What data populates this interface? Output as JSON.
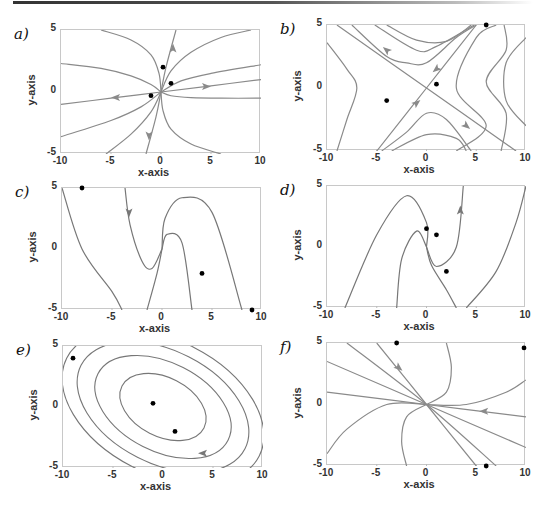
{
  "figure": {
    "panels": [
      {
        "id": "a",
        "label": "a)"
      },
      {
        "id": "b",
        "label": "b)"
      },
      {
        "id": "c",
        "label": "c)"
      },
      {
        "id": "d",
        "label": "d)"
      },
      {
        "id": "e",
        "label": "e)"
      },
      {
        "id": "f",
        "label": "f)"
      }
    ]
  },
  "chart_data": [
    {
      "panel": "a)",
      "type": "line",
      "title": "",
      "subtype": "phase portrait (unstable node)",
      "xlabel": "x-axis",
      "ylabel": "y-axis",
      "xlim": [
        -10,
        10
      ],
      "ylim": [
        -5,
        5
      ],
      "xticks": [
        "-10",
        "-5",
        "0",
        "5",
        "10"
      ],
      "yticks": [
        "-5",
        "0",
        "5"
      ],
      "grid": false,
      "line_color": "#8a8a8a",
      "points": [
        [
          0.2,
          2.0
        ],
        [
          1.0,
          0.7
        ],
        [
          -1.0,
          -0.3
        ]
      ],
      "trajectories": [
        [
          [
            -6,
            5
          ],
          [
            -3,
            4.2
          ],
          [
            -1,
            3
          ],
          [
            -0.2,
            1.5
          ],
          [
            0,
            0
          ]
        ],
        [
          [
            0,
            0
          ],
          [
            0.2,
            -1.5
          ],
          [
            1,
            -3
          ],
          [
            3,
            -4.2
          ],
          [
            6,
            -5
          ]
        ],
        [
          [
            -10,
            2.3
          ],
          [
            -6,
            1.9
          ],
          [
            -3,
            1.3
          ],
          [
            -1,
            0.6
          ],
          [
            0,
            0
          ]
        ],
        [
          [
            0,
            0
          ],
          [
            1,
            -0.3
          ],
          [
            3,
            -0.45
          ],
          [
            6,
            -0.5
          ],
          [
            10,
            -0.5
          ]
        ],
        [
          [
            0,
            0
          ],
          [
            1,
            1.7
          ],
          [
            3,
            3.2
          ],
          [
            6,
            4.4
          ],
          [
            9,
            5
          ]
        ],
        [
          [
            0,
            0
          ],
          [
            2,
            0.9
          ],
          [
            5,
            1.5
          ],
          [
            10,
            2.2
          ]
        ],
        [
          [
            -10,
            -1.0
          ],
          [
            -5,
            -0.5
          ],
          [
            0,
            0
          ],
          [
            5,
            0.5
          ],
          [
            10,
            1.0
          ]
        ],
        [
          [
            -1.5,
            -5
          ],
          [
            -0.5,
            -2
          ],
          [
            0,
            0
          ],
          [
            0.5,
            2
          ],
          [
            1.5,
            5
          ]
        ],
        [
          [
            -10,
            -3.6
          ],
          [
            -5,
            -2.3
          ],
          [
            -2,
            -1.2
          ],
          [
            0,
            0
          ]
        ],
        [
          [
            -5.5,
            -5
          ],
          [
            -3,
            -3.4
          ],
          [
            -1,
            -1.6
          ],
          [
            0,
            0
          ]
        ]
      ],
      "arrows": [
        [
          1.2,
          3.5,
          "up"
        ],
        [
          -4.5,
          -0.45,
          "left"
        ],
        [
          4.5,
          0.45,
          "right"
        ],
        [
          -1.2,
          -3.5,
          "down"
        ]
      ]
    },
    {
      "panel": "b)",
      "type": "line",
      "subtype": "phase portrait (saddle)",
      "xlabel": "x-axis",
      "ylabel": "y-axis",
      "xlim": [
        -10,
        10
      ],
      "ylim": [
        -5,
        5
      ],
      "xticks": [
        "-10",
        "-5",
        "0",
        "5",
        "10"
      ],
      "yticks": [
        "-5",
        "0",
        "5"
      ],
      "grid": false,
      "line_color": "#8a8a8a",
      "points": [
        [
          -4.0,
          -1.0
        ],
        [
          1.0,
          0.3
        ],
        [
          6.0,
          5.0
        ]
      ],
      "trajectories": [
        [
          [
            -9,
            5
          ],
          [
            0,
            0
          ],
          [
            9,
            -5
          ]
        ],
        [
          [
            -5,
            -5
          ],
          [
            0,
            0
          ],
          [
            5,
            5
          ]
        ],
        [
          [
            -10,
            3.6
          ],
          [
            -8,
            1.5
          ],
          [
            -7,
            0
          ],
          [
            -8,
            -2.5
          ],
          [
            -9,
            -5
          ]
        ],
        [
          [
            -7.5,
            5
          ],
          [
            -4,
            2.5
          ],
          [
            -2,
            2
          ],
          [
            0,
            2
          ],
          [
            3,
            4
          ],
          [
            5,
            5
          ]
        ],
        [
          [
            -5.2,
            5
          ],
          [
            -1,
            3
          ],
          [
            1,
            3.3
          ],
          [
            4.8,
            5
          ]
        ],
        [
          [
            -4,
            5
          ],
          [
            -1,
            3.8
          ],
          [
            2,
            3.7
          ],
          [
            4.5,
            5
          ]
        ],
        [
          [
            -4.5,
            -5
          ],
          [
            -2,
            -3.5
          ],
          [
            0,
            -2
          ],
          [
            2,
            -2.5
          ],
          [
            4.5,
            -5
          ]
        ],
        [
          [
            -3.5,
            -5
          ],
          [
            0,
            -3.7
          ],
          [
            3,
            -4
          ],
          [
            4,
            -5
          ]
        ],
        [
          [
            3,
            -5
          ],
          [
            6,
            -3
          ],
          [
            3,
            0
          ],
          [
            5,
            4
          ],
          [
            7,
            5
          ]
        ],
        [
          [
            7.5,
            -5
          ],
          [
            8,
            -2
          ],
          [
            6,
            0.5
          ],
          [
            8,
            3
          ],
          [
            7.8,
            5
          ]
        ],
        [
          [
            10,
            -3
          ],
          [
            8,
            -1
          ],
          [
            8,
            2
          ],
          [
            10,
            4
          ]
        ]
      ],
      "arrows": [
        [
          -4,
          3,
          "up-left"
        ],
        [
          4,
          -3,
          "down-right"
        ],
        [
          1,
          1.5,
          "down-left"
        ],
        [
          -1,
          -1.2,
          "up-right"
        ]
      ]
    },
    {
      "panel": "c)",
      "type": "line",
      "subtype": "phase portrait (stable spiral)",
      "xlabel": "x-axis",
      "ylabel": "y-axis",
      "xlim": [
        -10,
        10
      ],
      "ylim": [
        -5,
        5
      ],
      "xticks": [
        "-10",
        "-5",
        "0",
        "5",
        "10"
      ],
      "yticks": [
        "-5",
        "0",
        "5"
      ],
      "grid": false,
      "line_color": "#777777",
      "points": [
        [
          -8.0,
          5.0
        ],
        [
          4.0,
          -2.0
        ],
        [
          9.0,
          -5.0
        ]
      ],
      "trajectories": [
        [
          [
            -3.7,
            5
          ],
          [
            -3.2,
            2
          ],
          [
            -2,
            -1
          ],
          [
            -1,
            -1.6
          ],
          [
            0,
            0
          ]
        ],
        [
          [
            -10,
            5
          ],
          [
            -8,
            0
          ],
          [
            -5,
            -3.5
          ],
          [
            -4,
            -5
          ]
        ],
        [
          [
            -1.5,
            -5
          ],
          [
            -0.5,
            -2
          ],
          [
            0,
            0
          ]
        ],
        [
          [
            0,
            0
          ],
          [
            0.5,
            1.2
          ],
          [
            2,
            0.5
          ],
          [
            3,
            -5
          ]
        ],
        [
          [
            0,
            0
          ],
          [
            0.3,
            2.5
          ],
          [
            2,
            4.2
          ],
          [
            5,
            3
          ],
          [
            8,
            -5
          ]
        ]
      ],
      "arrows": [
        [
          -3.3,
          3,
          "down"
        ]
      ]
    },
    {
      "panel": "d)",
      "type": "line",
      "subtype": "phase portrait (unstable spiral)",
      "xlabel": "x-axis",
      "ylabel": "y-axis",
      "xlim": [
        -10,
        10
      ],
      "ylim": [
        -5,
        5
      ],
      "xticks": [
        "-10",
        "-5",
        "0",
        "5",
        "10"
      ],
      "yticks": [
        "-5",
        "0",
        "5"
      ],
      "grid": false,
      "line_color": "#777777",
      "points": [
        [
          0.0,
          1.5
        ],
        [
          1.0,
          1.0
        ],
        [
          2.0,
          -2.0
        ]
      ],
      "trajectories": [
        [
          [
            0,
            0
          ],
          [
            1,
            -1.6
          ],
          [
            3,
            0
          ],
          [
            3.7,
            5
          ]
        ],
        [
          [
            -8.2,
            -5
          ],
          [
            -5,
            1
          ],
          [
            -2,
            4.2
          ],
          [
            0,
            2
          ],
          [
            0,
            0
          ]
        ],
        [
          [
            -3,
            -5
          ],
          [
            -2.5,
            -1
          ],
          [
            -1,
            1.3
          ],
          [
            0,
            0
          ]
        ],
        [
          [
            0,
            0
          ],
          [
            0.5,
            -1.5
          ],
          [
            2,
            -3.5
          ],
          [
            3,
            -5
          ]
        ],
        [
          [
            4,
            -5
          ],
          [
            7,
            -2
          ],
          [
            9,
            2
          ],
          [
            10,
            5
          ]
        ]
      ],
      "arrows": [
        [
          3.4,
          3,
          "up"
        ]
      ]
    },
    {
      "panel": "e)",
      "type": "line",
      "subtype": "phase portrait (center / ellipses)",
      "xlabel": "x-axis",
      "ylabel": "y-axis",
      "xlim": [
        -10,
        10
      ],
      "ylim": [
        -5,
        5
      ],
      "xticks": [
        "-10",
        "-5",
        "0",
        "5",
        "10"
      ],
      "yticks": [
        "-5",
        "0",
        "5"
      ],
      "grid": false,
      "line_color": "#777777",
      "points": [
        [
          -9.0,
          4.0
        ],
        [
          -1.0,
          0.3
        ],
        [
          1.2,
          -2.0
        ]
      ],
      "ellipses": [
        {
          "rx": 4.6,
          "ry": 1.1
        },
        {
          "rx": 7.3,
          "ry": 1.65
        },
        {
          "rx": 9.2,
          "ry": 2.1
        },
        {
          "rx": 10.8,
          "ry": 2.5
        }
      ],
      "ellipse_center": [
        0,
        0
      ],
      "ellipse_angle_deg": -27,
      "arrows": [
        [
          4,
          -3.8,
          "left"
        ]
      ]
    },
    {
      "panel": "f)",
      "type": "line",
      "subtype": "phase portrait (stable node)",
      "xlabel": "x-axis",
      "ylabel": "y-axis",
      "xlim": [
        -10,
        10
      ],
      "ylim": [
        -5,
        5
      ],
      "xticks": [
        "-10",
        "-5",
        "0",
        "5",
        "10"
      ],
      "yticks": [
        "-5",
        "0",
        "5"
      ],
      "grid": false,
      "line_color": "#8a8a8a",
      "points": [
        [
          -3.0,
          5.0
        ],
        [
          9.8,
          4.6
        ],
        [
          6.0,
          -5.0
        ]
      ],
      "trajectories": [
        [
          [
            -5,
            5
          ],
          [
            0,
            0
          ],
          [
            5,
            -5
          ]
        ],
        [
          [
            -8,
            5
          ],
          [
            0,
            0
          ],
          [
            7,
            -5
          ]
        ],
        [
          [
            -10,
            3.5
          ],
          [
            0,
            0
          ],
          [
            10,
            -3.5
          ]
        ],
        [
          [
            -10,
            1
          ],
          [
            0,
            0
          ],
          [
            10,
            -1
          ]
        ],
        [
          [
            2,
            5
          ],
          [
            2.5,
            3
          ],
          [
            2,
            1
          ],
          [
            0,
            0
          ]
        ],
        [
          [
            -2,
            -5
          ],
          [
            -2.5,
            -3
          ],
          [
            -2,
            -1
          ],
          [
            0,
            0
          ]
        ],
        [
          [
            -10,
            -4
          ],
          [
            -8,
            -2
          ],
          [
            -4,
            0
          ],
          [
            0,
            0
          ]
        ],
        [
          [
            0,
            0
          ],
          [
            4,
            0
          ],
          [
            8,
            1
          ],
          [
            10,
            2
          ]
        ]
      ],
      "arrows": [
        [
          -2.8,
          3,
          "down-right"
        ],
        [
          5.8,
          -0.55,
          "left"
        ]
      ]
    }
  ]
}
